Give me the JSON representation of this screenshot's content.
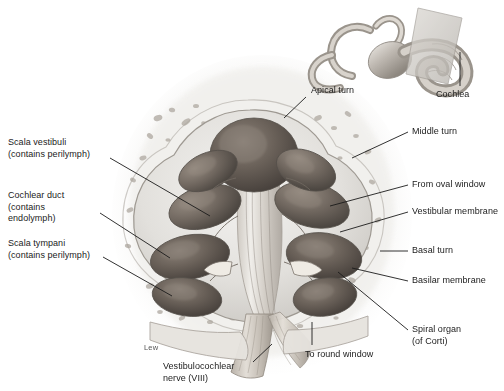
{
  "figure": {
    "signature": "Lew",
    "palette": {
      "bone_light": "#ededed",
      "bone_mid": "#d8d8d8",
      "bone_shadow": "#b4b4b4",
      "chamber_dark": "#4a4340",
      "chamber_mid": "#7a7168",
      "membrane": "#f2efe9",
      "nerve": "#cfc7bd",
      "leader_line": "#1b1b1b",
      "text": "#1b1b1b",
      "inset_body": "#b9b4ae",
      "inset_highlight": "#e6e2dc",
      "plane": "#cdc9c3"
    }
  },
  "labels": {
    "apical_turn": "Apical turn",
    "cochlea": "Cochlea",
    "middle_turn": "Middle turn",
    "from_oval_window": "From oval window",
    "vestibular_membrane": "Vestibular membrane",
    "basal_turn": "Basal turn",
    "basilar_membrane": "Basilar membrane",
    "spiral_organ": "Spiral organ\n(of Corti)",
    "to_round_window": "To round window",
    "vestibulocochlear_nerve": "Vestibulocochlear\nnerve (VIII)",
    "scala_vestibuli": "Scala vestibuli\n(contains perilymph)",
    "cochlear_duct": "Cochlear duct\n(contains\nendolymph)",
    "scala_tympani": "Scala tympani\n(contains perilymph)"
  }
}
